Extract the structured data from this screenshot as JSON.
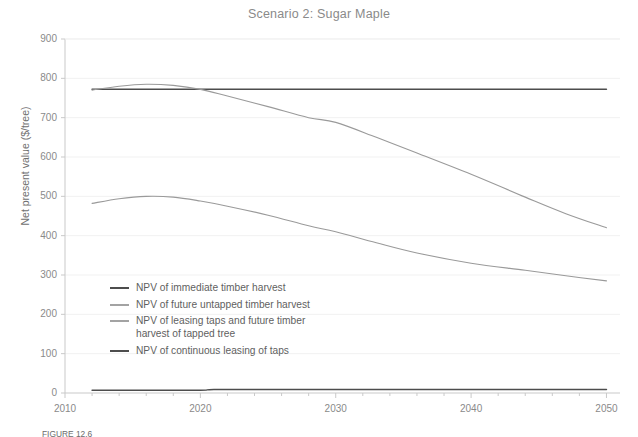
{
  "chart_data": {
    "type": "line",
    "title": "Scenario 2: Sugar Maple",
    "xlabel": "",
    "ylabel": "Net present value ($/tree)",
    "xlim": [
      2010,
      2051
    ],
    "ylim": [
      0,
      900
    ],
    "xticks": [
      2010,
      2020,
      2030,
      2040,
      2050
    ],
    "yticks": [
      0,
      100,
      200,
      300,
      400,
      500,
      600,
      700,
      800,
      900
    ],
    "minor_xtick_step": 2,
    "grid": "horizontal",
    "legend_position": "inside-lower-left",
    "series": [
      {
        "name": "NPV of immediate timber harvest",
        "color": "#4d4d4d",
        "x": [
          2012,
          2015,
          2020,
          2025,
          2030,
          2035,
          2040,
          2045,
          2050
        ],
        "values": [
          772,
          772,
          772,
          772,
          772,
          772,
          772,
          772,
          772
        ]
      },
      {
        "name": "NPV of future untapped timber harvest",
        "color": "#9a9a9a",
        "x": [
          2012,
          2014,
          2016,
          2018,
          2020,
          2022,
          2025,
          2028,
          2030,
          2033,
          2036,
          2040,
          2044,
          2047,
          2050
        ],
        "values": [
          770,
          780,
          785,
          782,
          772,
          755,
          728,
          700,
          688,
          650,
          610,
          556,
          498,
          456,
          420
        ]
      },
      {
        "name": "NPV of leasing taps and future timber\n    harvest of tapped tree",
        "color": "#9a9a9a",
        "x": [
          2012,
          2014,
          2016,
          2018,
          2020,
          2022,
          2025,
          2028,
          2030,
          2033,
          2036,
          2040,
          2044,
          2047,
          2050
        ],
        "values": [
          482,
          494,
          500,
          498,
          488,
          475,
          452,
          425,
          410,
          382,
          356,
          330,
          312,
          298,
          285
        ]
      },
      {
        "name": "NPV of continuous leasing of taps",
        "color": "#4d4d4d",
        "x": [
          2012,
          2016,
          2020,
          2021,
          2025,
          2030,
          2040,
          2050
        ],
        "values": [
          7,
          7,
          7,
          9,
          9,
          9,
          9,
          9
        ]
      }
    ]
  },
  "legend": {
    "items": [
      {
        "label": "NPV of immediate timber harvest",
        "color": "#4d4d4d"
      },
      {
        "label": "NPV of future untapped timber harvest",
        "color": "#a3a3a3"
      },
      {
        "label": "NPV of leasing taps and future timber\n      harvest of tapped tree",
        "color": "#a3a3a3"
      },
      {
        "label": "NPV of continuous leasing of taps",
        "color": "#4d4d4d"
      }
    ]
  },
  "caption": {
    "text": "FIGURE 12.6"
  },
  "colors": {
    "background": "#ffffff",
    "axis": "#c9c9c9",
    "grid": "#f1f1f1",
    "tick_text": "#8a8a8a",
    "title_text": "#8a8a8a",
    "dark_series": "#4d4d4d",
    "light_series": "#9a9a9a"
  }
}
